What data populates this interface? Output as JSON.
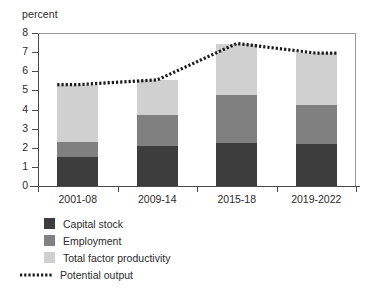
{
  "chart_data": {
    "type": "bar",
    "title": "",
    "subtitle": "",
    "xlabel": "",
    "ylabel": "percent",
    "ylim": [
      0,
      8
    ],
    "ytick_values": [
      0,
      1,
      2,
      3,
      4,
      5,
      6,
      7,
      8
    ],
    "ytick_labels": [
      "0",
      "1",
      "2",
      "3",
      "4",
      "5",
      "6",
      "7",
      "8"
    ],
    "grid": false,
    "stacked": true,
    "legend_position": "below-axis-left",
    "categories": [
      "2001-08",
      "2009-14",
      "2015-18",
      "2019-2022"
    ],
    "series": [
      {
        "name": "Capital stock",
        "type": "bar",
        "color": "#3d3d3d",
        "values": [
          1.5,
          2.1,
          2.25,
          2.2
        ]
      },
      {
        "name": "Employment",
        "type": "bar",
        "color": "#808080",
        "values": [
          0.8,
          1.6,
          2.5,
          2.05
        ]
      },
      {
        "name": "Total factor productivity",
        "type": "bar",
        "color": "#d0d0d0",
        "values": [
          3.0,
          1.85,
          2.7,
          2.7
        ]
      },
      {
        "name": "Potential output",
        "type": "line",
        "style": "dotted",
        "color": "#1a1a1a",
        "values": [
          5.3,
          5.55,
          7.45,
          6.95
        ]
      }
    ],
    "stack_tops": [
      [
        1.5,
        2.3,
        5.3
      ],
      [
        2.1,
        3.7,
        5.55
      ],
      [
        2.25,
        4.75,
        7.45
      ],
      [
        2.2,
        4.25,
        6.95
      ]
    ]
  },
  "axis": {
    "y_title": "percent"
  },
  "legend": {
    "items": [
      {
        "label": "Capital stock",
        "color": "#3d3d3d",
        "marker": "square"
      },
      {
        "label": "Employment",
        "color": "#808080",
        "marker": "square"
      },
      {
        "label": "Total factor productivity",
        "color": "#d0d0d0",
        "marker": "square"
      },
      {
        "label": "Potential output",
        "color": "#1a1a1a",
        "marker": "dotted-line"
      }
    ]
  },
  "colors": {
    "capital_stock": "#3d3d3d",
    "employment": "#808080",
    "total_factor_productivity": "#d0d0d0",
    "potential_output": "#1a1a1a",
    "axis": "#4a4a4a",
    "frame": "#9a9a9a",
    "text": "#2b2b2b",
    "background": "#ffffff"
  }
}
